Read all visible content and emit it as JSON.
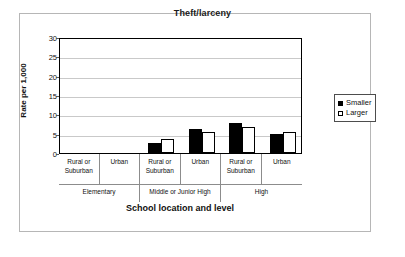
{
  "chart_data": {
    "type": "bar",
    "title": "Theft/larceny",
    "xlabel": "School location and level",
    "ylabel": "Rate per 1,000",
    "ylim": [
      0,
      30
    ],
    "yticks": [
      "0",
      "5",
      "10",
      "15",
      "20",
      "25",
      "30"
    ],
    "grid": true,
    "legend_position": "right",
    "categories": [
      "Rural or Suburban",
      "Urban",
      "Rural or Suburban",
      "Urban",
      "Rural or Suburban",
      "Urban"
    ],
    "category_lines": [
      [
        "Rural or",
        "Suburban"
      ],
      [
        "Urban"
      ],
      [
        "Rural or",
        "Suburban"
      ],
      [
        "Urban"
      ],
      [
        "Rural or",
        "Suburban"
      ],
      [
        "Urban"
      ]
    ],
    "groups": [
      {
        "label": "Elementary",
        "categories": [
          "Rural or Suburban",
          "Urban"
        ]
      },
      {
        "label": "Middle or Junior High",
        "categories": [
          "Rural or Suburban",
          "Urban"
        ]
      },
      {
        "label": "High",
        "categories": [
          "Rural or Suburban",
          "Urban"
        ]
      }
    ],
    "series": [
      {
        "name": "Smaller",
        "color": "#000000",
        "values": [
          null,
          null,
          2.5,
          6.3,
          7.7,
          5.0
        ]
      },
      {
        "name": "Larger",
        "color": "#ffffff",
        "values": [
          null,
          null,
          3.7,
          5.4,
          6.7,
          5.5
        ]
      }
    ]
  },
  "legend": {
    "items": [
      {
        "label": "Smaller",
        "swatch": "filled-square"
      },
      {
        "label": "Larger",
        "swatch": "hollow-square"
      }
    ]
  }
}
